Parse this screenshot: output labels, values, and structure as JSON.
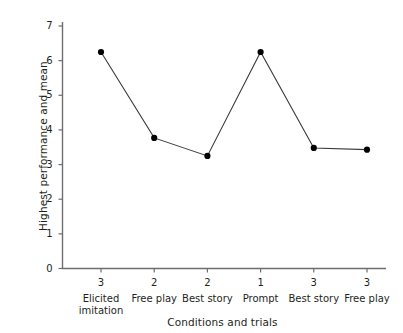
{
  "chart_data": {
    "type": "line",
    "title": "",
    "xlabel": "Conditions and trials",
    "ylabel": "Highest performance and mean",
    "categories": [
      "Elicited imitation",
      "Free play",
      "Best story",
      "Prompt",
      "Best story",
      "Free play"
    ],
    "category_lines": [
      [
        "Elicited",
        "imitation"
      ],
      [
        "Free play"
      ],
      [
        "Best story"
      ],
      [
        "Prompt"
      ],
      [
        "Best story"
      ],
      [
        "Free play"
      ]
    ],
    "trials": [
      "3",
      "2",
      "2",
      "1",
      "3",
      "3"
    ],
    "values": [
      6.25,
      3.77,
      3.25,
      6.25,
      3.48,
      3.43
    ],
    "ylim": [
      0,
      7
    ],
    "yticks": [
      "7",
      "6",
      "5",
      "4",
      "3",
      "2",
      "1",
      "0"
    ],
    "ytick_values": [
      7,
      6,
      5,
      4,
      3,
      2,
      1,
      0
    ],
    "grid": false,
    "legend": false,
    "legend_position": "none",
    "marker": "filled-circle",
    "colors": {
      "line": "#3a3a3a",
      "marker": "#000000",
      "axis": "#6d6e71",
      "text": "#231f20",
      "background": "#ffffff"
    }
  }
}
